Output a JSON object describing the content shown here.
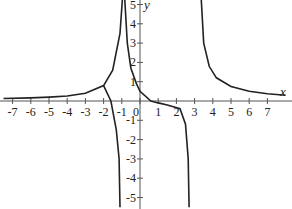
{
  "chart_data": {
    "type": "line",
    "title": "",
    "xlabel": "x",
    "ylabel": "y",
    "xlim": [
      -7.5,
      8
    ],
    "ylim": [
      -5.5,
      5.5
    ],
    "grid": false,
    "legend": null,
    "x_ticks": [
      -7,
      -6,
      -5,
      -4,
      -3,
      -2,
      -1,
      0,
      1,
      2,
      3,
      4,
      5,
      6,
      7
    ],
    "y_ticks": [
      -5,
      -4,
      -3,
      -2,
      -1,
      1,
      2,
      3,
      4,
      5
    ],
    "vertical_asymptotes_approx": [
      -0.8,
      2.8
    ],
    "horizontal_asymptote": 0,
    "x_intercepts_approx": [
      0.6,
      2.2
    ],
    "y_intercept_approx": 0.5,
    "series": [
      {
        "name": "left branch",
        "points": [
          [
            -7.5,
            0.13
          ],
          [
            -6,
            0.16
          ],
          [
            -5,
            0.2
          ],
          [
            -4,
            0.26
          ],
          [
            -3,
            0.4
          ],
          [
            -2,
            0.8
          ],
          [
            -1.5,
            1.6
          ],
          [
            -1.1,
            3.5
          ],
          [
            -0.95,
            5.5
          ]
        ]
      },
      {
        "name": "middle branch",
        "points": [
          [
            -0.85,
            5.5
          ],
          [
            -0.7,
            3.0
          ],
          [
            -0.5,
            1.7
          ],
          [
            -0.2,
            0.9
          ],
          [
            0,
            0.5
          ],
          [
            0.6,
            0
          ],
          [
            1,
            -0.1
          ],
          [
            1.5,
            -0.2
          ],
          [
            2.2,
            -0.4
          ],
          [
            2.5,
            -1.2
          ],
          [
            2.65,
            -3.0
          ],
          [
            2.7,
            -5.5
          ]
        ]
      },
      {
        "name": "right branch",
        "points": [
          [
            3.35,
            5.5
          ],
          [
            3.5,
            3.0
          ],
          [
            3.8,
            1.8
          ],
          [
            4.2,
            1.2
          ],
          [
            5,
            0.75
          ],
          [
            6,
            0.5
          ],
          [
            7,
            0.38
          ],
          [
            8,
            0.3
          ]
        ]
      }
    ],
    "series_left_lower": [
      [
        -2,
        0.8
      ],
      [
        -1.6,
        0
      ],
      [
        -1.3,
        -1.5
      ],
      [
        -1.15,
        -3.0
      ],
      [
        -1.1,
        -5.5
      ]
    ]
  },
  "axes": {
    "x_label": "x",
    "y_label": "y",
    "origin_label": "0"
  }
}
